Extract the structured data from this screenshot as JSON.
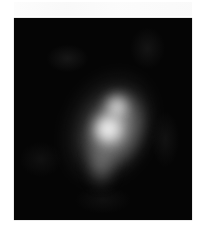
{
  "image": {
    "description": "Grayscale intensity image: diffuse bright blob on a black background",
    "background_color": "#050505",
    "page_background": "#ffffff",
    "blob": {
      "color": "#ffffff",
      "shape": "elongated diagonal glow, brightest near center"
    },
    "caption": ""
  }
}
